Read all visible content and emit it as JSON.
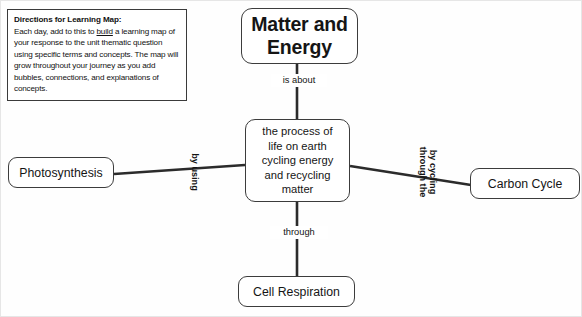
{
  "document": {
    "title": "Learning Map"
  },
  "directions": {
    "title": "Directions for Learning Map:",
    "body_before_underline": "Each day, add to this to ",
    "underlined_word": "build",
    "body_after_underline": " a learning map of your response to the unit thematic question using specific terms and concepts. The map will grow throughout your journey as you add bubbles, connections, and explanations of concepts."
  },
  "map": {
    "nodes": {
      "root": "Matter and\nEnergy",
      "center": "the process of\nlife on earth\ncycling energy\nand recycling\nmatter",
      "left": "Photosynthesis",
      "right": "Carbon Cycle",
      "bottom": "Cell Respiration"
    },
    "edge_labels": {
      "root_to_center": "is about",
      "center_to_bottom": "through",
      "center_to_left": "by using",
      "center_to_right_line1": "by cycling",
      "center_to_right_line2": "through the"
    }
  },
  "colors": {
    "node_border": "#3c3c3c",
    "text": "#151515",
    "edge_line": "#2b2b2b",
    "panel_border": "#3a3a3a",
    "canvas_background": "#fefefe"
  }
}
